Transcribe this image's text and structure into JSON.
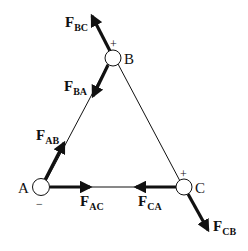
{
  "diagram": {
    "type": "truss free-body diagram",
    "nodes": [
      {
        "id": "A",
        "label": "A",
        "sign": "−"
      },
      {
        "id": "B",
        "label": "B",
        "sign": "+"
      },
      {
        "id": "C",
        "label": "C",
        "sign": "+"
      }
    ],
    "members": [
      {
        "from": "A",
        "to": "B"
      },
      {
        "from": "B",
        "to": "C"
      },
      {
        "from": "A",
        "to": "C"
      }
    ],
    "forces": [
      {
        "main": "F",
        "sub": "BC",
        "direction": "away from B, up-left"
      },
      {
        "main": "F",
        "sub": "BA",
        "direction": "from B toward A"
      },
      {
        "main": "F",
        "sub": "AB",
        "direction": "from A toward B"
      },
      {
        "main": "F",
        "sub": "AC",
        "direction": "from A toward C"
      },
      {
        "main": "F",
        "sub": "CA",
        "direction": "from C toward A"
      },
      {
        "main": "F",
        "sub": "CB",
        "direction": "away from C, down-right"
      }
    ],
    "colors": {
      "ink": "#111111",
      "background": "#ffffff"
    }
  }
}
